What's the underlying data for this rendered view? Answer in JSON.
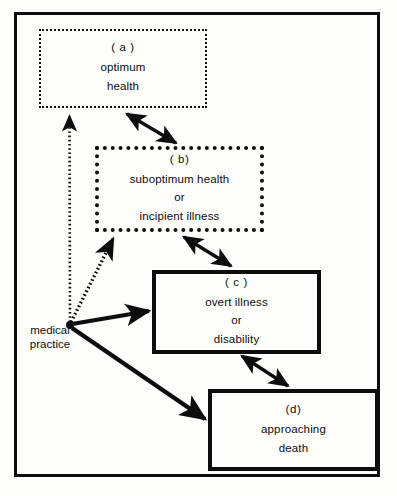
{
  "figure": {
    "background_color": "#fdfdfb",
    "ink_color": "#0d0d0d"
  },
  "nodes": [
    {
      "id": "a",
      "tag": "( a )",
      "lines": [
        "optimum",
        "health"
      ],
      "border_style": "fine-dotted",
      "border_color": "#111111"
    },
    {
      "id": "b",
      "tag": "( b)",
      "lines": [
        "suboptimum  health",
        "or",
        "incipient   illness"
      ],
      "border_style": "heavy-dotted",
      "border_color": "#111111"
    },
    {
      "id": "c",
      "tag": "( c )",
      "lines": [
        "overt illness",
        "or",
        "disability"
      ],
      "border_style": "solid-heavy",
      "border_color": "#0d0d0d"
    },
    {
      "id": "d",
      "tag": "(d)",
      "lines": [
        "approaching",
        "death"
      ],
      "border_style": "solid-heavy",
      "border_color": "#0d0d0d"
    }
  ],
  "hub": {
    "label_lines": [
      "medical",
      "practice"
    ],
    "label_text": "medical practice"
  },
  "connectors": [
    {
      "id": "a-b",
      "from": "a",
      "to": "b",
      "style": "solid",
      "heads": "double"
    },
    {
      "id": "b-c",
      "from": "b",
      "to": "c",
      "style": "solid",
      "heads": "double"
    },
    {
      "id": "c-d",
      "from": "c",
      "to": "d",
      "style": "solid",
      "heads": "double"
    },
    {
      "id": "hub-a",
      "from": "medical practice",
      "to": "a",
      "style": "dotted",
      "heads": "single"
    },
    {
      "id": "hub-b",
      "from": "medical practice",
      "to": "b",
      "style": "dotted",
      "heads": "single"
    },
    {
      "id": "hub-c",
      "from": "medical practice",
      "to": "c",
      "style": "solid",
      "heads": "single"
    },
    {
      "id": "hub-d",
      "from": "medical practice",
      "to": "d",
      "style": "solid",
      "heads": "single"
    }
  ]
}
